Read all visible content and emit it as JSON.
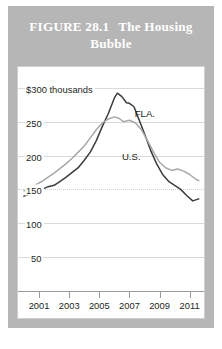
{
  "figure": {
    "number": "FIGURE 28.1",
    "title": "The Housing Bubble",
    "header_bg": "#b6b6b6",
    "header_text_color": "#ffffff"
  },
  "chart_data": {
    "type": "line",
    "title": "The Housing Bubble",
    "xlabel": "",
    "ylabel": "$300 thousands",
    "xlim": [
      2000,
      2011.75
    ],
    "ylim": [
      0,
      310
    ],
    "grid": true,
    "legend": "inline-labels",
    "y_ticks": [
      50,
      100,
      150,
      200,
      250,
      300
    ],
    "y_tick_labels": [
      "50",
      "100",
      "150",
      "200",
      "250",
      "$300 thousands"
    ],
    "x_ticks": [
      2001,
      2003,
      2005,
      2007,
      2009,
      2011
    ],
    "x_tick_labels": [
      "2001",
      "2003",
      "2005",
      "2007",
      "2009",
      "2011"
    ],
    "series": [
      {
        "name": "FLA.",
        "color": "#3c3c3c",
        "label_x": 2007.35,
        "label_y": 262,
        "x": [
          2000.0,
          2000.4,
          2000.8,
          2001.2,
          2001.6,
          2002.0,
          2002.4,
          2002.8,
          2003.2,
          2003.6,
          2004.0,
          2004.4,
          2004.8,
          2005.2,
          2005.6,
          2006.0,
          2006.2,
          2006.5,
          2006.8,
          2007.0,
          2007.3,
          2007.6,
          2008.0,
          2008.4,
          2008.8,
          2009.2,
          2009.6,
          2010.0,
          2010.4,
          2010.8,
          2011.2,
          2011.6
        ],
        "y": [
          140,
          143,
          147,
          150,
          154,
          156,
          162,
          168,
          175,
          182,
          193,
          205,
          222,
          243,
          262,
          285,
          292,
          287,
          278,
          277,
          272,
          255,
          232,
          208,
          188,
          172,
          162,
          156,
          150,
          141,
          133,
          136
        ]
      },
      {
        "name": "U.S.",
        "color": "#a8a8a8",
        "label_x": 2006.5,
        "label_y": 198,
        "x": [
          2000.0,
          2000.4,
          2000.8,
          2001.2,
          2001.6,
          2002.0,
          2002.4,
          2002.8,
          2003.2,
          2003.6,
          2004.0,
          2004.4,
          2004.8,
          2005.2,
          2005.6,
          2006.0,
          2006.3,
          2006.6,
          2007.0,
          2007.4,
          2007.8,
          2008.2,
          2008.6,
          2009.0,
          2009.4,
          2009.8,
          2010.2,
          2010.6,
          2011.0,
          2011.4,
          2011.6
        ],
        "y": [
          148,
          152,
          157,
          162,
          168,
          174,
          181,
          188,
          196,
          205,
          214,
          226,
          238,
          248,
          254,
          257,
          255,
          250,
          252,
          248,
          238,
          222,
          205,
          190,
          182,
          178,
          180,
          177,
          172,
          165,
          163
        ]
      }
    ]
  }
}
